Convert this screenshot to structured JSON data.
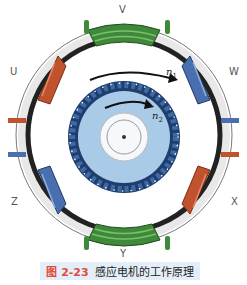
{
  "figure": {
    "number": "图 2-23",
    "title": "感应电机的工作原理"
  },
  "phase_labels": {
    "top": "V",
    "upper_left": "U",
    "upper_right": "W",
    "lower_left": "Z",
    "lower_right": "X",
    "bottom": "Y"
  },
  "speeds": {
    "stator_field": "n",
    "stator_field_sub": "1",
    "rotor": "n",
    "rotor_sub": "2"
  },
  "colors": {
    "coil_green": "#3f8a3a",
    "coil_red": "#c0522d",
    "coil_blue": "#4a6fae",
    "rotor_light": "#a9cbe8",
    "rotor_dark": "#1f3e6e",
    "caption_bg": "#e4eef8",
    "caption_accent": "#e04a3a"
  }
}
